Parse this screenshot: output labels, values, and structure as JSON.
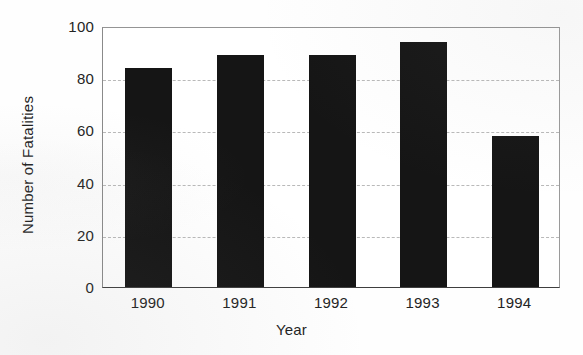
{
  "chart_data": {
    "type": "bar",
    "title": "",
    "categories": [
      "1990",
      "1991",
      "1992",
      "1993",
      "1994"
    ],
    "values": [
      84,
      89,
      89,
      94,
      58
    ],
    "series": [
      {
        "name": "Number of Fatalities",
        "values": [
          84,
          89,
          89,
          94,
          58
        ]
      }
    ],
    "xlabel": "Year",
    "ylabel": "Number of Fatalities",
    "ylim": [
      0,
      100
    ],
    "yticks": [
      0,
      20,
      40,
      60,
      80,
      100
    ],
    "ytick_labels": [
      "0",
      "20",
      "40",
      "60",
      "80",
      "100"
    ],
    "grid": "horizontal-dashed",
    "legend": "none",
    "bar_color": "#151515",
    "grid_color": "#b9b9b9",
    "frame_color": "#8d8d8d",
    "background_color": "#ffffff"
  },
  "axes": {
    "y_title": "Number of Fatalities",
    "x_title": "Year"
  }
}
